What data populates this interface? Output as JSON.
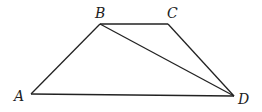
{
  "figure": {
    "type": "trapezoid-with-diagonal",
    "vertices": {
      "A": {
        "label": "A",
        "x": 31,
        "y": 94
      },
      "B": {
        "label": "B",
        "x": 100,
        "y": 24
      },
      "C": {
        "label": "C",
        "x": 168,
        "y": 24
      },
      "D": {
        "label": "D",
        "x": 234,
        "y": 96
      }
    },
    "segments": [
      "AB",
      "BC",
      "CD",
      "AD",
      "BD"
    ]
  }
}
